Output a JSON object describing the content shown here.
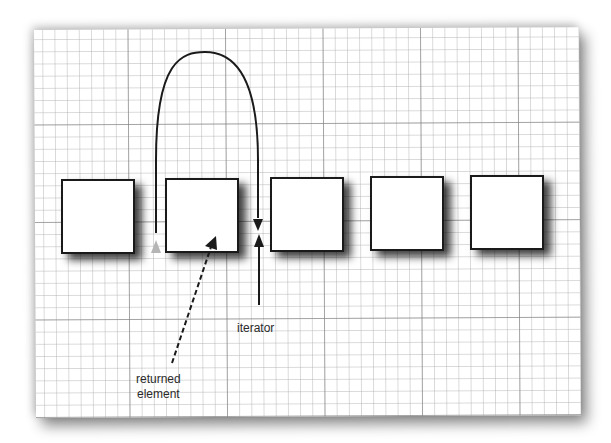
{
  "diagram": {
    "type": "linked-list-iterator",
    "nodes": [
      {
        "id": 1,
        "label": ""
      },
      {
        "id": 2,
        "label": ""
      },
      {
        "id": 3,
        "label": ""
      },
      {
        "id": 4,
        "label": ""
      },
      {
        "id": 5,
        "label": ""
      }
    ],
    "labels": {
      "iterator": "iterator",
      "returned_line1": "returned",
      "returned_line2": "element"
    },
    "colors": {
      "stroke": "#1a1a1a",
      "grid_major": "#8a8a8a",
      "grid_minor": "#bdbdbd",
      "paper": "#ffffff",
      "ghost_arrow": "#b0b0b0"
    }
  }
}
